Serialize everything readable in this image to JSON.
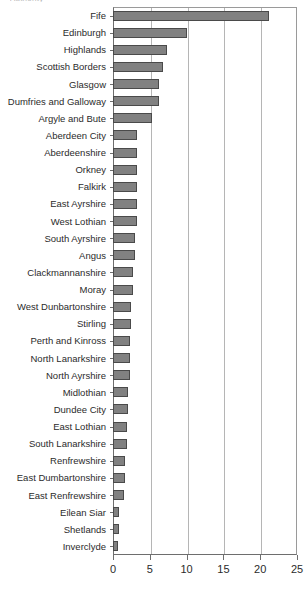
{
  "chart_data": {
    "type": "bar",
    "orientation": "horizontal",
    "title": "",
    "title_fragment": "Authority",
    "xlabel": "",
    "ylabel": "",
    "xlim": [
      0,
      25
    ],
    "xticks": [
      0,
      5,
      10,
      15,
      20,
      25
    ],
    "xtick_labels": [
      "0",
      "5",
      "10",
      "15",
      "20",
      "25"
    ],
    "grid": "vertical",
    "legend": "none",
    "bar_color": "#818181",
    "bar_edge_color": "#4a4a4a",
    "axis_color": "#6e6e6e",
    "gridline_color": "#b5b5b5",
    "categories": [
      "Fife",
      "Edinburgh",
      "Highlands",
      "Scottish Borders",
      "Glasgow",
      "Dumfries and Galloway",
      "Argyle and Bute",
      "Aberdeen City",
      "Aberdeenshire",
      "Orkney",
      "Falkirk",
      "East Ayrshire",
      "West Lothian",
      "South Ayrshire",
      "Angus",
      "Clackmannanshire",
      "Moray",
      "West Dunbartonshire",
      "Stirling",
      "Perth and Kinross",
      "North Lanarkshire",
      "North Ayrshire",
      "Midlothian",
      "Dundee City",
      "East Lothian",
      "South Lanarkshire",
      "Renfrewshire",
      "East Dumbartonshire",
      "East Renfrewshire",
      "Eilean Siar",
      "Shetlands",
      "Inverclyde"
    ],
    "values": [
      21.2,
      10.0,
      7.3,
      6.8,
      6.3,
      6.3,
      5.3,
      3.3,
      3.3,
      3.3,
      3.3,
      3.2,
      3.2,
      3.0,
      3.0,
      2.7,
      2.7,
      2.4,
      2.4,
      2.3,
      2.3,
      2.3,
      2.1,
      2.1,
      1.9,
      1.9,
      1.6,
      1.6,
      1.5,
      0.8,
      0.8,
      0.7
    ]
  }
}
